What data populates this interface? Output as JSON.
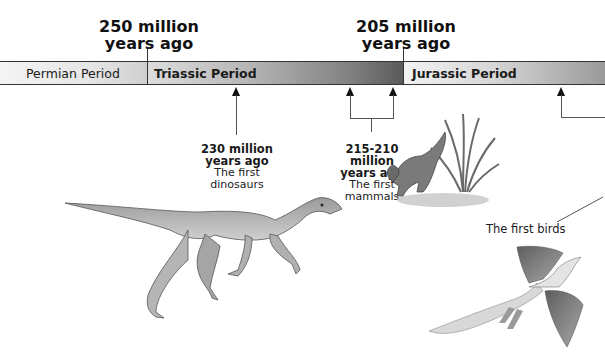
{
  "timeline": {
    "boundaries": [
      {
        "label_line1": "250 million",
        "label_line2": "years ago"
      },
      {
        "label_line1": "205 million",
        "label_line2": "years ago"
      }
    ],
    "periods": [
      {
        "name": "Permian Period"
      },
      {
        "name": "Triassic Period"
      },
      {
        "name": "Jurassic Period"
      }
    ],
    "events": [
      {
        "when_line1": "230 million",
        "when_line2": "years ago",
        "what_line1": "The first",
        "what_line2": "dinosaurs"
      },
      {
        "when_line1": "215-210 million",
        "when_line2": "years ago",
        "what_line1": "The first",
        "what_line2": "mammals"
      },
      {
        "caption": "The first birds"
      }
    ]
  },
  "illustrations": [
    {
      "subject": "early dinosaur (running theropod)"
    },
    {
      "subject": "early mammal-like creature with fern plant"
    },
    {
      "subject": "Archaeopteryx in flight"
    }
  ]
}
